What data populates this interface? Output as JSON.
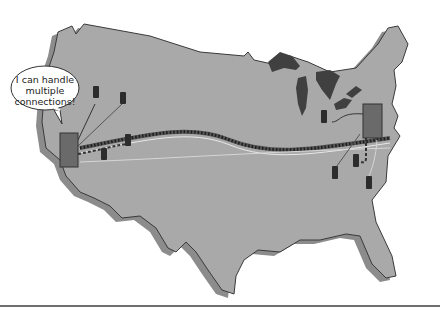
{
  "diagram": {
    "speech_bubble": {
      "line1": "I can handle",
      "line2": "multiple",
      "line3": "connections!"
    },
    "colors": {
      "land": "#a9a9a9",
      "land_shadow": "#8c8c8c",
      "outline": "#3a3a3a",
      "lakes": "#404040",
      "hub": "#6a6a6a",
      "server": "#2c2c2c",
      "background": "#ffffff"
    },
    "nodes": {
      "west_hub": {
        "label": "west-hub"
      },
      "east_hub": {
        "label": "east-hub"
      },
      "west_clients": 4,
      "east_clients": 4
    },
    "links": {
      "backbone": "wavy double dotted trunk line connecting west hub and east hub",
      "west_dashed": "dashed connection from west hub to client",
      "east_dashed": "dashed connection from east hub to client"
    }
  }
}
